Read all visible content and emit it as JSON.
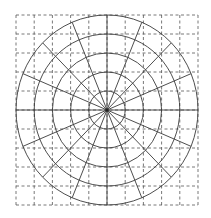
{
  "diagram": {
    "type": "polar-grid-over-square-grid",
    "canvas": {
      "width": 211,
      "height": 218,
      "background": "#ffffff"
    },
    "square_grid": {
      "x": 16,
      "y": 15,
      "width": 182,
      "height": 190,
      "columns": 10,
      "rows": 10,
      "line_style": "dashed",
      "color": "#555555"
    },
    "polar_grid": {
      "center": {
        "x": 107,
        "y": 110
      },
      "ring_count": 5,
      "ring_step_x": 18.2,
      "ring_step_y": 19,
      "spoke_count": 16,
      "spoke_angle_step_deg": 22.5,
      "line_style": "solid",
      "color": "#3a3a3a"
    }
  }
}
